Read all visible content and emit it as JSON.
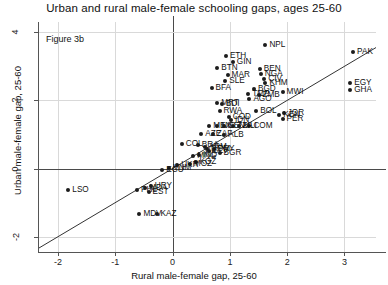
{
  "title": "Urban and rural male-female schooling gaps, ages 25-60",
  "figure_note": "Figure 3b",
  "chart_data": {
    "type": "scatter",
    "title": "Urban and rural male-female schooling gaps, ages 25-60",
    "annotation": "Figure 3b",
    "xlabel": "Rural male-female gap, 25-60",
    "ylabel": "Urban male-female gap, 25-60",
    "xlim": [
      -2.35,
      3.55
    ],
    "ylim": [
      -2.45,
      4.3
    ],
    "xticks": [
      -2,
      -1,
      0,
      1,
      2,
      3
    ],
    "yticks": [
      -2,
      0,
      2,
      4
    ],
    "grid": true,
    "legend": "none",
    "reference_line": {
      "type": "45-degree",
      "slope": 1,
      "intercept": 0
    },
    "points": [
      {
        "label": "NPL",
        "x": 1.62,
        "y": 3.62
      },
      {
        "label": "PAK",
        "x": 3.15,
        "y": 3.42
      },
      {
        "label": "ETH",
        "x": 0.93,
        "y": 3.3
      },
      {
        "label": "GIN",
        "x": 1.05,
        "y": 3.14
      },
      {
        "label": "BTN",
        "x": 0.78,
        "y": 2.94
      },
      {
        "label": "BEN",
        "x": 1.52,
        "y": 2.92
      },
      {
        "label": "NGA",
        "x": 1.54,
        "y": 2.78
      },
      {
        "label": "MAR",
        "x": 0.96,
        "y": 2.74
      },
      {
        "label": "CIV",
        "x": 1.6,
        "y": 2.62
      },
      {
        "label": "SLE",
        "x": 0.92,
        "y": 2.58
      },
      {
        "label": "KHM",
        "x": 1.62,
        "y": 2.5
      },
      {
        "label": "EGY",
        "x": 3.1,
        "y": 2.5
      },
      {
        "label": "BFA",
        "x": 0.68,
        "y": 2.36
      },
      {
        "label": "BGD",
        "x": 1.42,
        "y": 2.32
      },
      {
        "label": "GHA",
        "x": 3.1,
        "y": 2.3
      },
      {
        "label": "MWI",
        "x": 1.92,
        "y": 2.26
      },
      {
        "label": "TMP",
        "x": 1.32,
        "y": 2.18
      },
      {
        "label": "ZMB",
        "x": 1.5,
        "y": 2.16
      },
      {
        "label": "AGO",
        "x": 1.34,
        "y": 2.04
      },
      {
        "label": "MRT",
        "x": 0.78,
        "y": 1.92
      },
      {
        "label": "BDI",
        "x": 0.86,
        "y": 1.9
      },
      {
        "label": "RWA",
        "x": 0.82,
        "y": 1.7
      },
      {
        "label": "BOL",
        "x": 1.46,
        "y": 1.68
      },
      {
        "label": "JOR",
        "x": 1.94,
        "y": 1.62
      },
      {
        "label": "KEN",
        "x": 1.86,
        "y": 1.56
      },
      {
        "label": "COD",
        "x": 0.98,
        "y": 1.52
      },
      {
        "label": "PER",
        "x": 1.92,
        "y": 1.46
      },
      {
        "label": "IDN",
        "x": 1.02,
        "y": 1.42
      },
      {
        "label": "MEX",
        "x": 0.64,
        "y": 1.26
      },
      {
        "label": "COM",
        "x": 1.34,
        "y": 1.24
      },
      {
        "label": "NIC",
        "x": 0.78,
        "y": 1.24
      },
      {
        "label": "SEN",
        "x": 0.9,
        "y": 1.24
      },
      {
        "label": "TZA",
        "x": 1.06,
        "y": 1.24
      },
      {
        "label": "MLI",
        "x": 1.16,
        "y": 1.24
      },
      {
        "label": "AZE",
        "x": 0.5,
        "y": 1.02
      },
      {
        "label": "ZAF",
        "x": 0.7,
        "y": 1.0
      },
      {
        "label": "ALB",
        "x": 0.9,
        "y": 0.98
      },
      {
        "label": "COL",
        "x": 0.16,
        "y": 0.72
      },
      {
        "label": "BRA",
        "x": 0.44,
        "y": 0.7
      },
      {
        "label": "ARM",
        "x": 0.56,
        "y": 0.64
      },
      {
        "label": "DOM",
        "x": 0.6,
        "y": 0.58
      },
      {
        "label": "PRY",
        "x": 0.72,
        "y": 0.56
      },
      {
        "label": "SLV",
        "x": 0.64,
        "y": 0.5
      },
      {
        "label": "BGR",
        "x": 0.82,
        "y": 0.46
      },
      {
        "label": "IND",
        "x": 0.46,
        "y": 0.4
      },
      {
        "label": "MNG",
        "x": 0.36,
        "y": 0.36
      },
      {
        "label": "KGZ",
        "x": 0.4,
        "y": 0.18
      },
      {
        "label": "MOZ",
        "x": 0.3,
        "y": 0.14
      },
      {
        "label": "UKR",
        "x": 0.08,
        "y": 0.1
      },
      {
        "label": "VNM",
        "x": -0.06,
        "y": 0.02
      },
      {
        "label": "ECU",
        "x": -0.18,
        "y": -0.04
      },
      {
        "label": "LSO",
        "x": -1.82,
        "y": -0.62
      },
      {
        "label": "PHL",
        "x": -0.62,
        "y": -0.62
      },
      {
        "label": "EST",
        "x": -0.42,
        "y": -0.68
      },
      {
        "label": "MDA",
        "x": -0.48,
        "y": -0.56
      },
      {
        "label": "URY",
        "x": -0.38,
        "y": -0.52
      },
      {
        "label": "MDV",
        "x": -0.58,
        "y": -1.34
      },
      {
        "label": "KAZ",
        "x": -0.28,
        "y": -1.34
      }
    ]
  },
  "axes": {
    "x": {
      "label": "Rural male-female gap, 25-60",
      "ticks": [
        "-2",
        "-1",
        "0",
        "1",
        "2",
        "3"
      ]
    },
    "y": {
      "label": "Urban male-female gap, 25-60",
      "ticks": [
        "-2",
        "0",
        "2",
        "4"
      ]
    }
  }
}
